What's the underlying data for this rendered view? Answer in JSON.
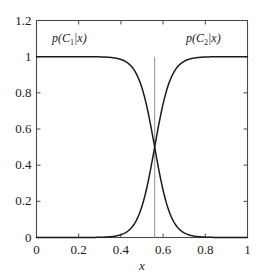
{
  "chart_data": {
    "type": "line",
    "title": "",
    "xlabel": "x",
    "ylabel": "",
    "xlim": [
      0,
      1
    ],
    "ylim": [
      0,
      1.2
    ],
    "grid": false,
    "legend_position": "inline-annotations",
    "xticks": [
      "0",
      "0.2",
      "0.4",
      "0.6",
      "0.8",
      "1"
    ],
    "xtick_values": [
      0,
      0.2,
      0.4,
      0.6,
      0.8,
      1
    ],
    "yticks": [
      "0",
      "0.2",
      "0.4",
      "0.6",
      "0.8",
      "1",
      "1.2"
    ],
    "ytick_values": [
      0,
      0.2,
      0.4,
      0.6,
      0.8,
      1,
      1.2
    ],
    "decision_boundary": {
      "x": 0.56,
      "color": "#9a9a9a",
      "label": ""
    },
    "series": [
      {
        "name": "p(C1|x)",
        "color": "#1a1a1a",
        "form": "logistic-decreasing",
        "midpoint": 0.56,
        "steepness": 26,
        "x": [
          0.0,
          0.05,
          0.1,
          0.15,
          0.2,
          0.25,
          0.3,
          0.32,
          0.34,
          0.36,
          0.38,
          0.4,
          0.42,
          0.44,
          0.46,
          0.48,
          0.5,
          0.52,
          0.54,
          0.56,
          0.58,
          0.6,
          0.62,
          0.64,
          0.66,
          0.68,
          0.7,
          0.72,
          0.74,
          0.76,
          0.8,
          0.85,
          0.9,
          0.95,
          1.0
        ],
        "values": [
          1.0,
          1.0,
          0.999,
          0.999,
          0.997,
          0.993,
          0.975,
          0.96,
          0.935,
          0.895,
          0.835,
          0.748,
          0.635,
          0.5,
          0.365,
          0.252,
          0.165,
          0.105,
          0.065,
          0.5,
          0.024,
          0.014,
          0.009,
          0.005,
          0.003,
          0.002,
          0.001,
          0.001,
          0.0,
          0.0,
          0.0,
          0.0,
          0.0,
          0.0,
          0.0
        ]
      },
      {
        "name": "p(C2|x)",
        "color": "#1a1a1a",
        "form": "logistic-increasing",
        "midpoint": 0.56,
        "steepness": 26,
        "x": [
          0.0,
          0.05,
          0.1,
          0.15,
          0.2,
          0.25,
          0.3,
          0.32,
          0.34,
          0.36,
          0.38,
          0.4,
          0.42,
          0.44,
          0.46,
          0.48,
          0.5,
          0.52,
          0.54,
          0.56,
          0.58,
          0.6,
          0.62,
          0.64,
          0.66,
          0.68,
          0.7,
          0.72,
          0.74,
          0.76,
          0.8,
          0.85,
          0.9,
          0.95,
          1.0
        ],
        "values": [
          0.0,
          0.0,
          0.001,
          0.001,
          0.003,
          0.007,
          0.025,
          0.04,
          0.065,
          0.105,
          0.165,
          0.252,
          0.365,
          0.5,
          0.635,
          0.748,
          0.835,
          0.895,
          0.935,
          0.5,
          0.976,
          0.986,
          0.991,
          0.995,
          0.997,
          0.998,
          0.999,
          0.999,
          1.0,
          1.0,
          1.0,
          1.0,
          1.0,
          1.0,
          1.0
        ]
      }
    ],
    "annotations": [
      {
        "text_html": "p(<span class=\"cal\">C</span><sub>1</sub>|x)",
        "text": "p(C1|x)",
        "x": 0.26,
        "y": 1.11
      },
      {
        "text_html": "p(<span class=\"cal\">C</span><sub>2</sub>|x)",
        "text": "p(C2|x)",
        "x": 0.82,
        "y": 1.11
      }
    ],
    "style": {
      "axis_color": "#4a4a4a",
      "curve_color": "#1a1a1a",
      "background": "#ffffff",
      "tick_direction": "in"
    }
  },
  "labels": {
    "y": [
      "0",
      "0.2",
      "0.4",
      "0.6",
      "0.8",
      "1",
      "1.2"
    ],
    "x": [
      "0",
      "0.2",
      "0.4",
      "0.6",
      "0.8",
      "1"
    ],
    "xaxis_title": "x",
    "left_curve": "p(C1|x)",
    "right_curve": "p(C2|x)"
  }
}
